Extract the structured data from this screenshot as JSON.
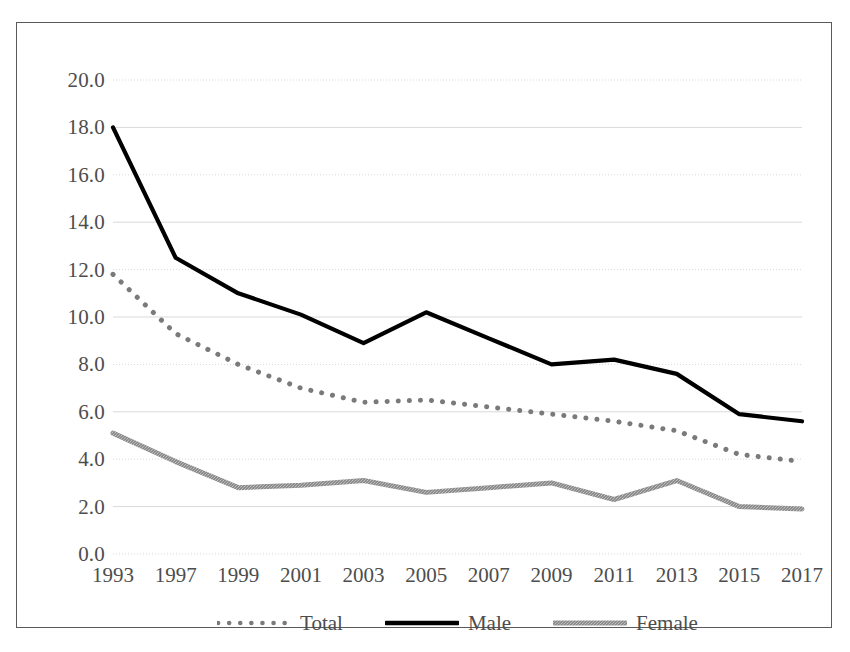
{
  "chart_data": {
    "type": "line",
    "title": "",
    "subtitle": "",
    "xlabel": "",
    "ylabel": "",
    "categories": [
      "1993",
      "1997",
      "1999",
      "2001",
      "2003",
      "2005",
      "2007",
      "2009",
      "2011",
      "2013",
      "2015",
      "2017"
    ],
    "series": [
      {
        "name": "Total",
        "style": "dotted",
        "color": "#7a7a7a",
        "values": [
          11.8,
          9.3,
          8.0,
          7.0,
          6.4,
          6.5,
          6.2,
          5.9,
          5.6,
          5.2,
          4.2,
          3.9
        ]
      },
      {
        "name": "Male",
        "style": "solid",
        "color": "#000000",
        "values": [
          18.0,
          12.5,
          11.0,
          10.1,
          8.9,
          10.2,
          9.1,
          8.0,
          8.2,
          7.6,
          5.9,
          5.6
        ]
      },
      {
        "name": "Female",
        "style": "textured",
        "color": "#808080",
        "values": [
          5.1,
          3.9,
          2.8,
          2.9,
          3.1,
          2.6,
          2.8,
          3.0,
          2.3,
          3.1,
          2.0,
          1.9
        ]
      }
    ],
    "ylim": [
      0.0,
      20.0
    ],
    "y_ticks": [
      0.0,
      2.0,
      4.0,
      6.0,
      8.0,
      10.0,
      12.0,
      14.0,
      16.0,
      18.0,
      20.0
    ],
    "y_tick_labels": [
      "0.0",
      "2.0",
      "4.0",
      "6.0",
      "8.0",
      "10.0",
      "12.0",
      "14.0",
      "16.0",
      "18.0",
      "20.0"
    ],
    "grid": true,
    "grid_color": "#d9d9d9",
    "legend_position": "bottom",
    "legend_entries": [
      "Total",
      "Male",
      "Female"
    ],
    "frame_color": "#5a5a5a",
    "background": "#ffffff"
  }
}
